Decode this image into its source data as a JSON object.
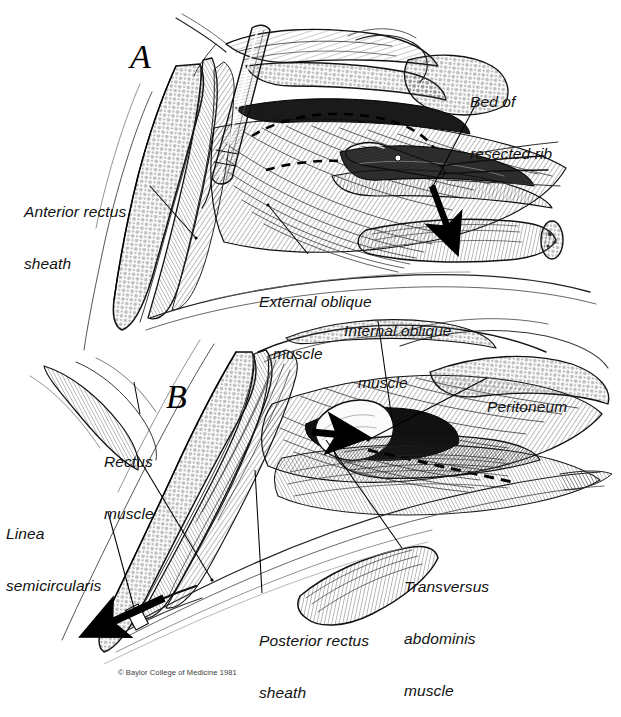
{
  "figure": {
    "type": "medical-illustration",
    "style": "pen-and-ink line engraving, black on white",
    "panels": [
      {
        "id": "A",
        "letter": "A",
        "x": 130,
        "y": 38,
        "description": "Upper panel: anterior rectus sheath incised, external oblique exposed, rib resected with retractor and scissors in field"
      },
      {
        "id": "B",
        "letter": "B",
        "x": 166,
        "y": 378,
        "description": "Lower panel: deeper dissection showing internal oblique, transversus abdominis, posterior rectus sheath and peritoneum"
      }
    ],
    "labels": [
      {
        "id": "anterior-rectus-sheath",
        "lines": [
          "Anterior rectus",
          "sheath"
        ],
        "x": 24,
        "y": 168,
        "align": "left",
        "leader": {
          "x1": 150,
          "y1": 186,
          "x2": 196,
          "y2": 238
        }
      },
      {
        "id": "bed-of-resected-rib",
        "lines": [
          "Bed of",
          "resected rib"
        ],
        "x": 470,
        "y": 58,
        "align": "left",
        "leader": {
          "x1": 478,
          "y1": 100,
          "x2": 433,
          "y2": 186
        }
      },
      {
        "id": "external-oblique-muscle",
        "lines": [
          "External oblique",
          "muscle"
        ],
        "x": 259,
        "y": 258,
        "align": "left",
        "leader": {
          "x1": 308,
          "y1": 254,
          "x2": 268,
          "y2": 205
        }
      },
      {
        "id": "internal-oblique-muscle",
        "lines": [
          "Internal oblique",
          "muscle"
        ],
        "x": 344,
        "y": 287,
        "align": "left",
        "leader": {
          "x1": 378,
          "y1": 321,
          "x2": 392,
          "y2": 420
        }
      },
      {
        "id": "peritoneum",
        "lines": [
          "Peritoneum"
        ],
        "x": 487,
        "y": 363,
        "align": "left",
        "leader": {
          "x1": 487,
          "y1": 378,
          "x2": 368,
          "y2": 440
        }
      },
      {
        "id": "rectus-muscle",
        "lines": [
          "Rectus",
          "muscle"
        ],
        "x": 104,
        "y": 418,
        "align": "left",
        "leader": {
          "x1": 140,
          "y1": 414,
          "x2": 134,
          "y2": 382
        }
      },
      {
        "id": "rectus-muscle-second-leader",
        "lines": [],
        "x": 0,
        "y": 0,
        "align": "left",
        "leader": {
          "x1": 137,
          "y1": 455,
          "x2": 212,
          "y2": 580
        }
      },
      {
        "id": "linea-semicircularis",
        "lines": [
          "Linea",
          "semicircularis"
        ],
        "x": 6,
        "y": 490,
        "align": "left",
        "leader": {
          "x1": 108,
          "y1": 512,
          "x2": 134,
          "y2": 608
        }
      },
      {
        "id": "posterior-rectus-sheath",
        "lines": [
          "Posterior rectus",
          "sheath"
        ],
        "x": 259,
        "y": 597,
        "align": "left",
        "leader": {
          "x1": 262,
          "y1": 593,
          "x2": 255,
          "y2": 470
        }
      },
      {
        "id": "transversus-abdominis-muscle",
        "lines": [
          "Transversus",
          "abdominis",
          "muscle"
        ],
        "x": 404,
        "y": 543,
        "align": "left",
        "leader": {
          "x1": 402,
          "y1": 548,
          "x2": 326,
          "y2": 440
        }
      }
    ],
    "arrows": [
      {
        "id": "rib-displacement-arrow",
        "note": "bold solid arrow in panel A pointing down to resected rib",
        "x1": 432,
        "y1": 188,
        "x2": 455,
        "y2": 252
      },
      {
        "id": "peritoneum-entry-arrow",
        "note": "bold solid arrow in panel B pointing right into peritoneal space",
        "x1": 316,
        "y1": 430,
        "x2": 363,
        "y2": 437
      },
      {
        "id": "linea-semicircularis-arrow",
        "note": "bold solid arrow in panel B pointing lower-left along rectus",
        "x1": 160,
        "y1": 600,
        "x2": 88,
        "y2": 633
      }
    ],
    "dashed_lines": [
      {
        "id": "incision-dashed-upper",
        "note": "dashed incision outline over external oblique, panel A"
      },
      {
        "id": "incision-dashed-lower",
        "note": "dashed incision line along transversus abdominis, panel B"
      }
    ],
    "instruments": [
      {
        "id": "retractor-blade",
        "note": "long flat retractor blade, upper left of panel A"
      },
      {
        "id": "scissors",
        "note": "curved scissors at rib bed, panel A"
      },
      {
        "id": "forceps-tips",
        "note": "fine forceps/probe tips at right of panel A"
      }
    ],
    "copyright": "© Baylor College of Medicine 1981",
    "copyright_pos": {
      "x": 118,
      "y": 668
    }
  }
}
